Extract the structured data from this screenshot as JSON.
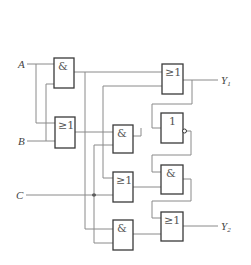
{
  "diagram": {
    "type": "logic-circuit",
    "inputs": [
      {
        "id": "A",
        "label": "A"
      },
      {
        "id": "B",
        "label": "B"
      },
      {
        "id": "C",
        "label": "C"
      }
    ],
    "outputs": [
      {
        "id": "Y1",
        "label": "Y",
        "subscript": "1"
      },
      {
        "id": "Y2",
        "label": "Y",
        "subscript": "2"
      }
    ],
    "gates": [
      {
        "id": "g1",
        "symbol": "&",
        "kind": "AND"
      },
      {
        "id": "g2",
        "symbol": "≥1",
        "kind": "OR"
      },
      {
        "id": "g3",
        "symbol": "≥1",
        "kind": "OR"
      },
      {
        "id": "g4",
        "symbol": "&",
        "kind": "AND"
      },
      {
        "id": "g5",
        "symbol": "1",
        "kind": "NOT"
      },
      {
        "id": "g6",
        "symbol": "≥1",
        "kind": "OR"
      },
      {
        "id": "g7",
        "symbol": "&",
        "kind": "AND"
      },
      {
        "id": "g8",
        "symbol": "&",
        "kind": "AND"
      },
      {
        "id": "g9",
        "symbol": "≥1",
        "kind": "OR"
      }
    ],
    "colors": {
      "wire": "#8a8a8a",
      "gate_border": "#3a3a3a",
      "background": "#ffffff"
    }
  }
}
